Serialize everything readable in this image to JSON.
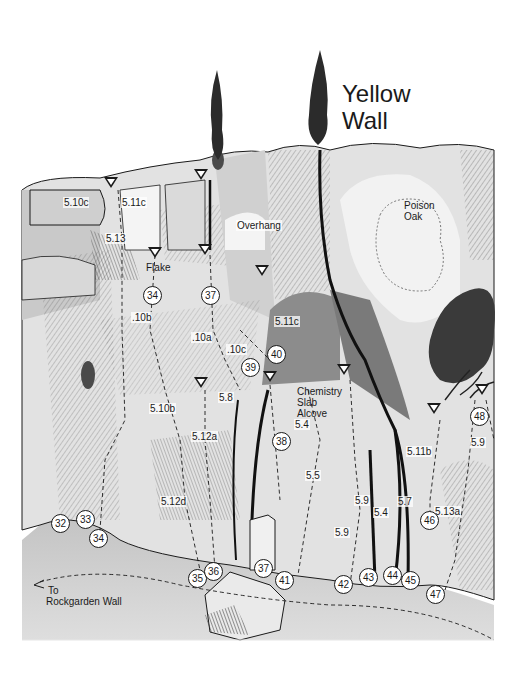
{
  "title": {
    "line1": "Yellow",
    "line2": "Wall"
  },
  "features": {
    "overhang": "Overhang",
    "flake": "Flake",
    "poison_oak_1": "Poison",
    "poison_oak_2": "Oak",
    "alcove_1": "Chemistry",
    "alcove_2": "Slab",
    "alcove_3": "Alcove",
    "trail_1": "To",
    "trail_2": "Rockgarden Wall"
  },
  "grades": [
    {
      "text": "5.10c",
      "x": 75,
      "y": 203
    },
    {
      "text": "5.11c",
      "x": 133,
      "y": 203
    },
    {
      "text": "5.13",
      "x": 117,
      "y": 239
    },
    {
      "text": ".10b",
      "x": 143,
      "y": 318
    },
    {
      "text": ".10a",
      "x": 203,
      "y": 338
    },
    {
      "text": ".10c",
      "x": 238,
      "y": 350
    },
    {
      "text": "5.11c",
      "x": 286,
      "y": 322
    },
    {
      "text": "5.8",
      "x": 230,
      "y": 398
    },
    {
      "text": "5.10b",
      "x": 161,
      "y": 409
    },
    {
      "text": "5.12a",
      "x": 203,
      "y": 437
    },
    {
      "text": "5.4",
      "x": 306,
      "y": 425
    },
    {
      "text": "5.5",
      "x": 317,
      "y": 476
    },
    {
      "text": "5.12d",
      "x": 172,
      "y": 502
    },
    {
      "text": "5.9",
      "x": 366,
      "y": 501
    },
    {
      "text": "5.9",
      "x": 346,
      "y": 533
    },
    {
      "text": "5.4",
      "x": 385,
      "y": 513
    },
    {
      "text": "5.7",
      "x": 409,
      "y": 502
    },
    {
      "text": "5.11b",
      "x": 418,
      "y": 452
    },
    {
      "text": "5.13a",
      "x": 446,
      "y": 512
    },
    {
      "text": "5.9",
      "x": 482,
      "y": 443
    }
  ],
  "routes": [
    {
      "n": "32",
      "x": 61,
      "y": 524
    },
    {
      "n": "33",
      "x": 86,
      "y": 520
    },
    {
      "n": "34",
      "x": 99,
      "y": 539
    },
    {
      "n": "34",
      "x": 153,
      "y": 296
    },
    {
      "n": "37",
      "x": 211,
      "y": 296
    },
    {
      "n": "39",
      "x": 251,
      "y": 368
    },
    {
      "n": "40",
      "x": 277,
      "y": 355
    },
    {
      "n": "38",
      "x": 282,
      "y": 442
    },
    {
      "n": "35",
      "x": 198,
      "y": 579
    },
    {
      "n": "36",
      "x": 214,
      "y": 572
    },
    {
      "n": "37",
      "x": 264,
      "y": 569
    },
    {
      "n": "41",
      "x": 285,
      "y": 581
    },
    {
      "n": "42",
      "x": 344,
      "y": 585
    },
    {
      "n": "43",
      "x": 369,
      "y": 578
    },
    {
      "n": "44",
      "x": 393,
      "y": 576
    },
    {
      "n": "45",
      "x": 411,
      "y": 581
    },
    {
      "n": "46",
      "x": 430,
      "y": 521
    },
    {
      "n": "47",
      "x": 436,
      "y": 595
    },
    {
      "n": "48",
      "x": 480,
      "y": 417
    }
  ],
  "anchors": [
    {
      "x": 111,
      "y": 183
    },
    {
      "x": 201,
      "y": 175
    },
    {
      "x": 155,
      "y": 253
    },
    {
      "x": 205,
      "y": 250
    },
    {
      "x": 262,
      "y": 271
    },
    {
      "x": 201,
      "y": 383
    },
    {
      "x": 270,
      "y": 377
    },
    {
      "x": 344,
      "y": 370
    },
    {
      "x": 434,
      "y": 409
    },
    {
      "x": 482,
      "y": 390
    }
  ],
  "colors": {
    "ink": "#1a1a1a",
    "rock_light": "#e8e8e8",
    "rock_mid": "#b4b4b4",
    "rock_dark": "#6a6a6a",
    "ground": "#cfcfcf"
  }
}
